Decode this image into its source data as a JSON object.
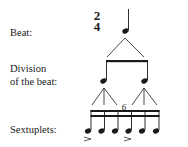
{
  "labels": {
    "beat": "Beat:",
    "division_line1": "Division",
    "division_line2": "of the beat:",
    "sextuplets": "Sextuplets:"
  },
  "time_signature": {
    "top": "2",
    "bottom": "4"
  },
  "tuplet_number": "6",
  "levels": [
    {
      "name": "Beat",
      "notes": 1,
      "value": "quarter"
    },
    {
      "name": "Division of the beat",
      "notes": 2,
      "value": "eighth"
    },
    {
      "name": "Sextuplets",
      "notes": 6,
      "value": "sixteenth",
      "accents": [
        1,
        4
      ]
    }
  ]
}
